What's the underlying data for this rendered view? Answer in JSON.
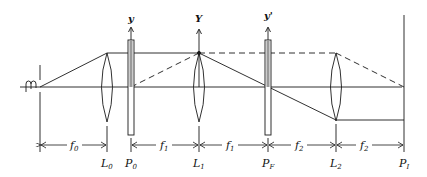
{
  "diagram": {
    "title": "",
    "colors": {
      "line": "#1a1a1a",
      "plate_fill": "#9a9a9a",
      "background": "#ffffff"
    },
    "axis_labels": {
      "p0": "y",
      "l1": "Y",
      "pf": "y'"
    },
    "elements": [
      {
        "id": "source",
        "label": ""
      },
      {
        "id": "L0",
        "label": "L",
        "sub": "0"
      },
      {
        "id": "P0",
        "label": "P",
        "sub": "0"
      },
      {
        "id": "L1",
        "label": "L",
        "sub": "1"
      },
      {
        "id": "PF",
        "label": "P",
        "sub": "F"
      },
      {
        "id": "L2",
        "label": "L",
        "sub": "2"
      },
      {
        "id": "Pf",
        "label": "P",
        "sub": "I"
      }
    ],
    "dimensions": [
      {
        "label": "f",
        "sub": "0"
      },
      {
        "label": "f",
        "sub": "1"
      },
      {
        "label": "f",
        "sub": "1"
      },
      {
        "label": "f",
        "sub": "2"
      },
      {
        "label": "f",
        "sub": "2"
      }
    ]
  }
}
